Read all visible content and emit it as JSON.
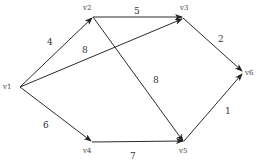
{
  "diagram": {
    "type": "directed weighted graph",
    "nodes": [
      {
        "id": "v1",
        "label": "v1",
        "x": 18,
        "y": 87
      },
      {
        "id": "v2",
        "label": "v2",
        "x": 92,
        "y": 17
      },
      {
        "id": "v3",
        "label": "v3",
        "x": 182,
        "y": 17
      },
      {
        "id": "v4",
        "label": "v4",
        "x": 91,
        "y": 142
      },
      {
        "id": "v5",
        "label": "v5",
        "x": 183,
        "y": 142
      },
      {
        "id": "v6",
        "label": "v6",
        "x": 243,
        "y": 72
      }
    ],
    "edges": [
      {
        "from": "v1",
        "to": "v2",
        "weight": "4"
      },
      {
        "from": "v1",
        "to": "v3",
        "weight": "8"
      },
      {
        "from": "v1",
        "to": "v4",
        "weight": "6"
      },
      {
        "from": "v2",
        "to": "v3",
        "weight": "5"
      },
      {
        "from": "v2",
        "to": "v5",
        "weight": "8"
      },
      {
        "from": "v3",
        "to": "v6",
        "weight": "2"
      },
      {
        "from": "v4",
        "to": "v5",
        "weight": "7"
      },
      {
        "from": "v5",
        "to": "v6",
        "weight": "1"
      }
    ]
  }
}
